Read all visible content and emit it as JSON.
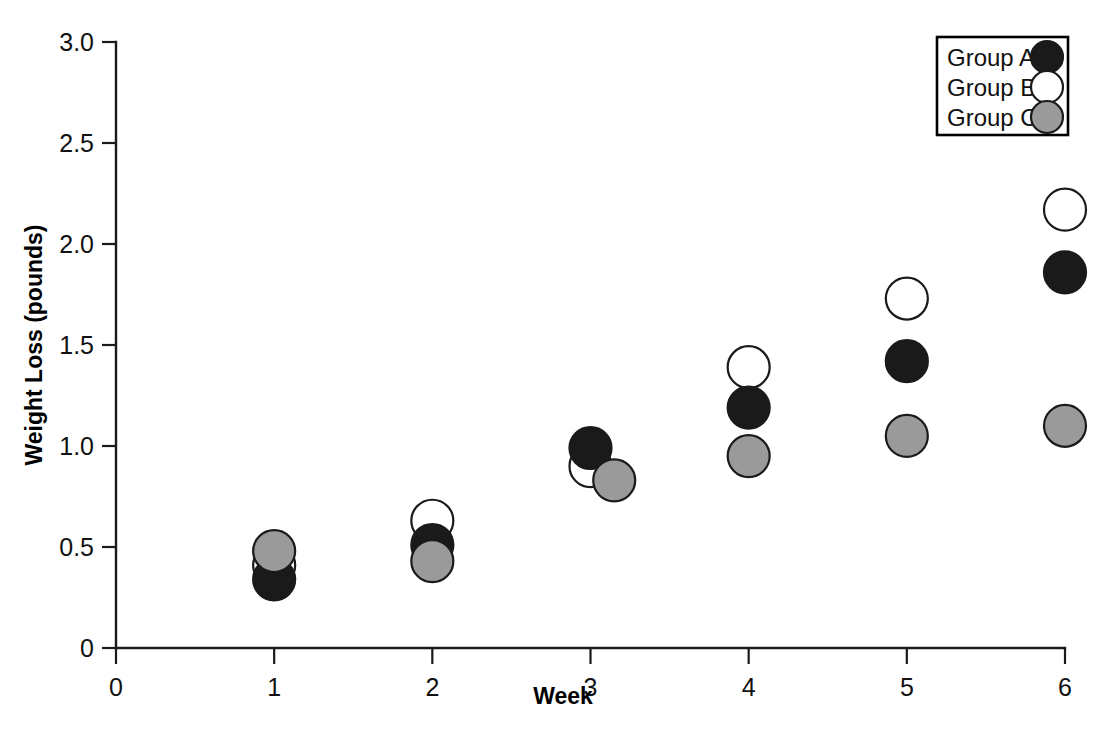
{
  "chart_data": {
    "type": "scatter",
    "title": "",
    "xlabel": "Week",
    "ylabel": "Weight Loss (pounds)",
    "x": [
      1,
      2,
      3,
      4,
      5,
      6
    ],
    "xlim": [
      0,
      6
    ],
    "ylim": [
      0,
      3.0
    ],
    "xticks": [
      "0",
      "1",
      "2",
      "3",
      "4",
      "5",
      "6"
    ],
    "xtick_values": [
      0,
      1,
      2,
      3,
      4,
      5,
      6
    ],
    "yticks": [
      "0",
      "0.5",
      "1.0",
      "1.5",
      "2.0",
      "2.5",
      "3.0"
    ],
    "ytick_values": [
      0,
      0.5,
      1.0,
      1.5,
      2.0,
      2.5,
      3.0
    ],
    "grid": false,
    "legend_position": "top-right",
    "series": [
      {
        "name": "Group A",
        "marker": "filled-circle-black",
        "fill": "#1a1a1a",
        "edge": "#111111",
        "x": [
          1,
          2,
          3,
          4,
          5,
          6
        ],
        "values": [
          0.34,
          0.51,
          0.99,
          1.19,
          1.42,
          1.86
        ]
      },
      {
        "name": "Group B",
        "marker": "open-circle-white",
        "fill": "#ffffff",
        "edge": "#111111",
        "x": [
          1,
          2,
          3,
          4,
          5,
          6
        ],
        "values": [
          0.41,
          0.63,
          0.9,
          1.39,
          1.73,
          2.17
        ]
      },
      {
        "name": "Group C",
        "marker": "filled-circle-gray",
        "fill": "#9a9a9a",
        "edge": "#111111",
        "x": [
          1,
          2,
          3.15,
          4,
          5,
          6
        ],
        "values": [
          0.48,
          0.43,
          0.83,
          0.95,
          1.05,
          1.1
        ]
      }
    ]
  },
  "legend": {
    "entries": [
      {
        "label": "Group A"
      },
      {
        "label": "Group B"
      },
      {
        "label": "Group C"
      }
    ]
  },
  "axes": {
    "x_title": "Week",
    "y_title": "Weight Loss (pounds)"
  }
}
